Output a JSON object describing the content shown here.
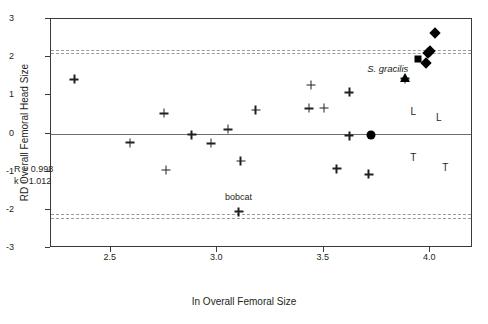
{
  "chart_data": {
    "type": "scatter",
    "title": "",
    "xlabel": "In Overall Femoral Size",
    "ylabel": "RD Overall Femoral Head Size",
    "xlim": [
      2.22,
      4.2
    ],
    "ylim": [
      -3,
      3
    ],
    "xticks": [
      2.5,
      3.0,
      3.5,
      4.0
    ],
    "xtick_labels": [
      "2.5",
      "3.0",
      "3.5",
      "4.0"
    ],
    "yticks": [
      3,
      2,
      1,
      0,
      -1,
      -2,
      -3
    ],
    "ytick_labels": [
      "3",
      "2",
      "1",
      "0",
      "-1",
      "-2",
      "-3"
    ],
    "grid": false,
    "legend": null,
    "zero_line": 0,
    "confidence_bands": [
      2.2,
      2.1,
      -2.12,
      -2.22
    ],
    "annotations": [
      {
        "text": "R = 0.998",
        "x": 2.32,
        "y": -1.52
      },
      {
        "text": "k = 1.012",
        "x": 2.32,
        "y": -1.82
      },
      {
        "text": "bobcat",
        "x": 3.1,
        "y": -1.66,
        "style": "plain"
      },
      {
        "text": "S. gracilis",
        "x": 3.8,
        "y": 1.72,
        "style": "italic"
      },
      {
        "text": "L",
        "x": 3.92,
        "y": 0.6,
        "style": "letter"
      },
      {
        "text": "L",
        "x": 4.04,
        "y": 0.42,
        "style": "letter"
      },
      {
        "text": "T",
        "x": 3.92,
        "y": -0.62,
        "style": "letter"
      },
      {
        "text": "T",
        "x": 4.07,
        "y": -0.88,
        "style": "letter"
      }
    ],
    "series": [
      {
        "name": "extant comparative sample",
        "marker": "plus",
        "points": [
          {
            "x": 2.33,
            "y": 1.42
          },
          {
            "x": 2.59,
            "y": -0.24
          },
          {
            "x": 2.75,
            "y": 0.53
          },
          {
            "x": 2.76,
            "y": -0.96
          },
          {
            "x": 2.88,
            "y": -0.03
          },
          {
            "x": 2.97,
            "y": -0.26
          },
          {
            "x": 3.05,
            "y": 0.11
          },
          {
            "x": 3.11,
            "y": -0.72
          },
          {
            "x": 3.18,
            "y": 0.62
          },
          {
            "x": 3.44,
            "y": 1.27
          },
          {
            "x": 3.43,
            "y": 0.66
          },
          {
            "x": 3.5,
            "y": 0.67
          },
          {
            "x": 3.56,
            "y": -0.92
          },
          {
            "x": 3.62,
            "y": 1.08
          },
          {
            "x": 3.62,
            "y": -0.06
          },
          {
            "x": 3.71,
            "y": -1.07
          },
          {
            "x": 3.88,
            "y": 1.44
          },
          {
            "x": 3.1,
            "y": -2.05
          }
        ]
      },
      {
        "name": "diamond specimens",
        "marker": "diamond",
        "points": [
          {
            "x": 4.02,
            "y": 2.64
          },
          {
            "x": 4.0,
            "y": 2.17
          },
          {
            "x": 3.99,
            "y": 2.11
          },
          {
            "x": 3.98,
            "y": 1.84
          }
        ]
      },
      {
        "name": "square specimen",
        "marker": "square",
        "points": [
          {
            "x": 3.94,
            "y": 1.96
          }
        ]
      },
      {
        "name": "triangle specimen",
        "marker": "triangle",
        "points": [
          {
            "x": 3.88,
            "y": 1.45
          }
        ]
      },
      {
        "name": "circle specimen",
        "marker": "circle",
        "points": [
          {
            "x": 3.72,
            "y": -0.03
          }
        ]
      }
    ],
    "colors": {
      "marker": "#000000",
      "axis": "#3a3a3a",
      "zero_line": "#6e6e6e",
      "ci_line": "#9a9a9a",
      "text": "#231f20",
      "background": "#ffffff"
    }
  }
}
